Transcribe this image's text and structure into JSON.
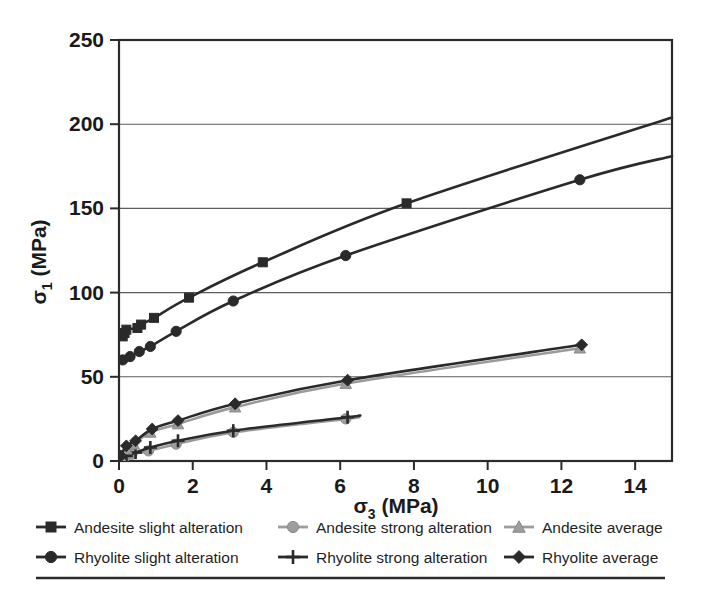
{
  "chart_data": {
    "type": "scatter",
    "title": "",
    "xlabel": "σ₃ (MPa)",
    "ylabel": "σ₁ (MPa)",
    "xlabel_base": "σ",
    "xlabel_sub": "3",
    "xlabel_unit": " (MPa)",
    "ylabel_base": "σ",
    "ylabel_sub": "1",
    "ylabel_unit": " (MPa)",
    "xlim": [
      0,
      15
    ],
    "ylim": [
      0,
      250
    ],
    "xticks": [
      0,
      2,
      4,
      6,
      8,
      10,
      12,
      14
    ],
    "yticks": [
      0,
      50,
      100,
      150,
      200,
      250
    ],
    "grid": "horizontal",
    "gridlines_y": [
      50,
      100,
      150,
      200
    ],
    "legend_position": "below",
    "legend_columns": 3,
    "legend_rows": 2,
    "series": [
      {
        "name": "Andesite slight alteration",
        "marker": "square",
        "color": "#2a2a2a",
        "line_color": "#2a2a2a",
        "x": [
          0.1,
          0.15,
          0.2,
          0.5,
          0.6,
          0.95,
          1.9,
          3.9,
          7.8
        ],
        "y": [
          74,
          76,
          78,
          79,
          81,
          85,
          97,
          118,
          153
        ],
        "fit_end_x": 15,
        "fit_end_y": 204
      },
      {
        "name": "Rhyolite slight alteration",
        "marker": "circle",
        "color": "#2a2a2a",
        "line_color": "#2a2a2a",
        "x": [
          0.1,
          0.3,
          0.55,
          0.85,
          1.55,
          3.1,
          6.15,
          12.5
        ],
        "y": [
          60,
          62,
          65,
          68,
          77,
          95,
          122,
          167
        ],
        "fit_end_x": 15,
        "fit_end_y": 181
      },
      {
        "name": "Andesite strong alteration",
        "marker": "circle",
        "color": "#9d9d9d",
        "line_color": "#9d9d9d",
        "x": [
          0.05,
          0.15,
          0.35,
          0.8,
          1.55,
          3.1,
          6.15
        ],
        "y": [
          1,
          2,
          4,
          6,
          10,
          17,
          25
        ],
        "fit_end_x": 6.5,
        "fit_end_y": 26
      },
      {
        "name": "Rhyolite strong alteration",
        "marker": "plus",
        "color": "#2a2a2a",
        "line_color": "#2a2a2a",
        "x": [
          0.05,
          0.2,
          0.45,
          0.85,
          1.6,
          3.1,
          6.2
        ],
        "y": [
          1,
          3,
          5,
          8,
          12,
          18,
          26
        ],
        "fit_end_x": 6.5,
        "fit_end_y": 27
      },
      {
        "name": "Andesite average",
        "marker": "triangle",
        "color": "#9d9d9d",
        "line_color": "#9d9d9d",
        "x": [
          0.05,
          0.2,
          0.4,
          0.85,
          1.6,
          3.15,
          6.15,
          12.5
        ],
        "y": [
          2,
          7,
          10,
          17,
          22,
          32,
          46,
          67
        ]
      },
      {
        "name": "Rhyolite average",
        "marker": "diamond",
        "color": "#2a2a2a",
        "line_color": "#2a2a2a",
        "x": [
          0.05,
          0.2,
          0.45,
          0.9,
          1.6,
          3.15,
          6.2,
          12.55
        ],
        "y": [
          3,
          9,
          12,
          19,
          24,
          34,
          48,
          69
        ]
      }
    ]
  },
  "legend": {
    "items": [
      {
        "label": "Andesite slight alteration",
        "marker": "square",
        "color": "#2a2a2a"
      },
      {
        "label": "Andesite strong alteration",
        "marker": "circle",
        "color": "#9d9d9d"
      },
      {
        "label": "Andesite average",
        "marker": "triangle",
        "color": "#9d9d9d"
      },
      {
        "label": "Rhyolite slight alteration",
        "marker": "circle",
        "color": "#2a2a2a"
      },
      {
        "label": "Rhyolite strong alteration",
        "marker": "plus",
        "color": "#2a2a2a"
      },
      {
        "label": "Rhyolite average",
        "marker": "diamond",
        "color": "#2a2a2a"
      }
    ]
  },
  "axis": {
    "x_tick_labels": [
      "0",
      "2",
      "4",
      "6",
      "8",
      "10",
      "12",
      "14"
    ],
    "y_tick_labels": [
      "0",
      "50",
      "100",
      "150",
      "200",
      "250"
    ]
  },
  "colors": {
    "dark": "#2a2a2a",
    "gray": "#9d9d9d",
    "grid": "#5d5d5d",
    "background": "#ffffff"
  }
}
